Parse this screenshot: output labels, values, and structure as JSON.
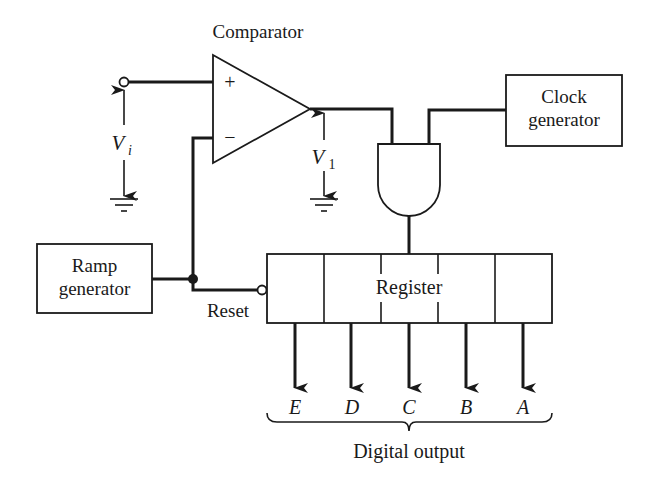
{
  "diagram": {
    "title": "Comparator",
    "comparator": {
      "plus": "+",
      "minus": "−"
    },
    "clock": {
      "line1": "Clock",
      "line2": "generator"
    },
    "ramp": {
      "line1": "Ramp",
      "line2": "generator"
    },
    "register": {
      "label": "Register"
    },
    "reset_label": "Reset",
    "vi": {
      "main": "V",
      "sub": "i"
    },
    "v1": {
      "main": "V",
      "sub": "1"
    },
    "outputs": [
      "E",
      "D",
      "C",
      "B",
      "A"
    ],
    "output_label": "Digital output"
  }
}
